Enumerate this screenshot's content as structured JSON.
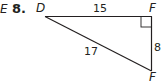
{
  "problem": {
    "prefix": "E",
    "number": "8."
  },
  "triangle": {
    "vertices": {
      "top_left": "D",
      "top_right": "F",
      "bottom_right": "F"
    },
    "sides": {
      "top": "15",
      "right": "8",
      "hypotenuse": "17"
    },
    "right_angle_at": "top_right",
    "stroke_color": "#231f20"
  }
}
